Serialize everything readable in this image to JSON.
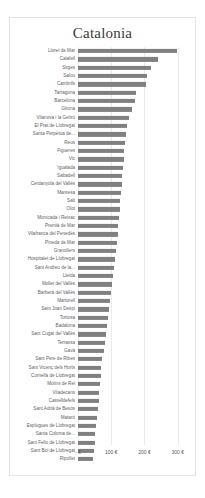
{
  "chart_data": {
    "type": "bar",
    "orientation": "horizontal",
    "title": "Catalonia",
    "xlabel": "",
    "ylabel": "",
    "xlim": [
      0,
      340
    ],
    "grid": true,
    "legend": false,
    "axis_tick_labels": [
      "- €",
      "100 €",
      "200 €",
      "300 €"
    ],
    "axis_tick_values": [
      0,
      100,
      200,
      300
    ],
    "currency": "€",
    "bar_color": "#808080",
    "categories": [
      "Lloret de Mar",
      "Calafell",
      "Sitges",
      "Salou",
      "Cambrils",
      "Tarragona",
      "Barcelona",
      "Girona",
      "Vilanova i la Geltrú",
      "El Prat de Llobregat",
      "Santa Perpètua de...",
      "Reus",
      "Figueres",
      "Vic",
      "Igualada",
      "Sabadell",
      "Cerdanyola del Vallès",
      "Manresa",
      "Salt",
      "Olot",
      "Montcada i Reixac",
      "Premià de Mar",
      "Vilafranca del Penedès",
      "Pineda de Mar",
      "Granollers",
      "Hospitalet de Llobregat",
      "Sant Andreu de la...",
      "Lleida",
      "Mollet del Vallès",
      "Barberà del Vallès",
      "Martorell",
      "Sant Joan Despi",
      "Tortosa",
      "Badalona",
      "Sant Cugat del Vallès",
      "Terrassa",
      "Gavà",
      "Sant Pere de Ribes",
      "Sant Vicenç dels Horts",
      "Cornellà de Llobregat",
      "Molins de Rei",
      "Viladecans",
      "Castelldefels",
      "Sant Adrià de Besòs",
      "Mataró",
      "Esplugues de Llobregat",
      "Santa Coloma de...",
      "Sant Feliu de Llobregat",
      "Sant Boi de Llobregat",
      "Ripollet"
    ],
    "values": [
      298,
      240,
      221,
      207,
      204,
      176,
      172,
      163,
      152,
      147,
      144,
      141,
      139,
      137,
      135,
      133,
      131,
      129,
      127,
      125,
      123,
      121,
      119,
      117,
      115,
      110,
      107,
      104,
      101,
      98,
      95,
      92,
      89,
      86,
      83,
      80,
      77,
      72,
      70,
      68,
      66,
      64,
      62,
      60,
      58,
      54,
      52,
      50,
      48,
      44
    ]
  }
}
